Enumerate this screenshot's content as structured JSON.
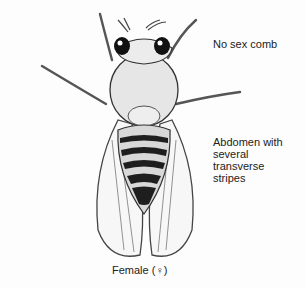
{
  "figure": {
    "labels": {
      "sex_comb": "No sex comb",
      "abdomen": "Abdomen with several transverse stripes",
      "caption": "Female (♀)"
    }
  }
}
